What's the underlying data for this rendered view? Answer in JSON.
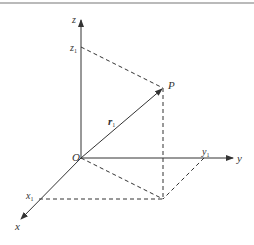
{
  "diagram": {
    "type": "3d-coordinate-position-vector",
    "colors": {
      "line": "#333333",
      "border": "#777777",
      "background": "#ffffff"
    },
    "axes": {
      "x": {
        "label": "x",
        "tick_label": "x",
        "tick_sub": "1"
      },
      "y": {
        "label": "y",
        "tick_label": "y",
        "tick_sub": "1"
      },
      "z": {
        "label": "z",
        "tick_label": "z",
        "tick_sub": "1"
      }
    },
    "origin": {
      "label": "O"
    },
    "point": {
      "label": "P"
    },
    "vector": {
      "label": "r",
      "sub": "1"
    }
  }
}
